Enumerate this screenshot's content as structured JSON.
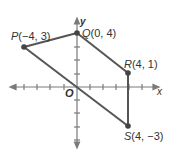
{
  "diagram": {
    "type": "coordinate-plane-quadrilateral",
    "axes": {
      "x_label": "x",
      "y_label": "y",
      "origin_label": "O"
    },
    "points": [
      {
        "name": "P",
        "coords": "(−4, 3)",
        "x": -4,
        "y": 3
      },
      {
        "name": "Q",
        "coords": "(0, 4)",
        "x": 0,
        "y": 4
      },
      {
        "name": "R",
        "coords": "(4, 1)",
        "x": 4,
        "y": 1
      },
      {
        "name": "S",
        "coords": "(4, −3)",
        "x": 4,
        "y": -3
      }
    ],
    "segments": [
      [
        "P",
        "Q"
      ],
      [
        "Q",
        "R"
      ],
      [
        "R",
        "S"
      ],
      [
        "S",
        "P"
      ]
    ],
    "colors": {
      "line": "#555555",
      "point": "#444444",
      "axis": "#777777"
    }
  }
}
